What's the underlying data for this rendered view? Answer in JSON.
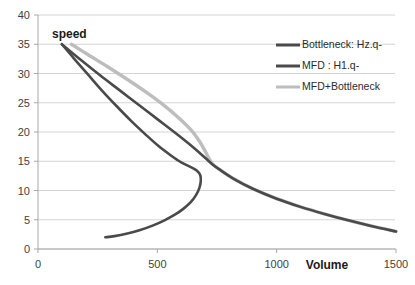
{
  "chart_data": {
    "type": "line",
    "title": "",
    "xlabel": "Volume",
    "ylabel": "speed",
    "xlim": [
      0,
      1500
    ],
    "ylim": [
      0,
      40
    ],
    "xticks": [
      "0",
      "500",
      "1000",
      "1500"
    ],
    "xtick_values": [
      0,
      500,
      1000,
      1500
    ],
    "yticks": [
      "0",
      "5",
      "10",
      "15",
      "20",
      "25",
      "30",
      "35",
      "40"
    ],
    "ytick_values": [
      0,
      5,
      10,
      15,
      20,
      25,
      30,
      35,
      40
    ],
    "grid": "horizontal",
    "legend_position": "upper-right-inside",
    "series": [
      {
        "name": "Bottleneck: Hz.q-",
        "color": "#4a4a4a",
        "width": 2.6,
        "points": [
          [
            100,
            35.0
          ],
          [
            150,
            32.6
          ],
          [
            210,
            29.8
          ],
          [
            270,
            27.0
          ],
          [
            330,
            24.4
          ],
          [
            390,
            21.9
          ],
          [
            450,
            19.6
          ],
          [
            505,
            17.6
          ],
          [
            560,
            15.9
          ],
          [
            600,
            14.8
          ],
          [
            640,
            14.0
          ],
          [
            665,
            13.4
          ],
          [
            680,
            12.6
          ],
          [
            682,
            11.6
          ],
          [
            676,
            10.4
          ],
          [
            662,
            9.2
          ],
          [
            640,
            8.0
          ],
          [
            610,
            6.9
          ],
          [
            575,
            5.9
          ],
          [
            530,
            4.9
          ],
          [
            480,
            4.0
          ],
          [
            425,
            3.2
          ],
          [
            370,
            2.6
          ],
          [
            320,
            2.2
          ],
          [
            282,
            2.0
          ]
        ]
      },
      {
        "name": "MFD : H1.q-",
        "color": "#4a4a4a",
        "width": 2.6,
        "points": [
          [
            100,
            35.0
          ],
          [
            180,
            32.3
          ],
          [
            260,
            29.7
          ],
          [
            340,
            27.2
          ],
          [
            420,
            24.7
          ],
          [
            500,
            22.2
          ],
          [
            580,
            19.7
          ],
          [
            650,
            17.4
          ],
          [
            700,
            15.6
          ],
          [
            730,
            14.5
          ],
          [
            760,
            13.6
          ],
          [
            820,
            12.0
          ],
          [
            900,
            10.3
          ],
          [
            1000,
            8.6
          ],
          [
            1100,
            7.2
          ],
          [
            1200,
            6.0
          ],
          [
            1300,
            4.9
          ],
          [
            1400,
            3.9
          ],
          [
            1500,
            3.0
          ]
        ]
      },
      {
        "name": "MFD+Bottleneck",
        "color": "#bdbdbd",
        "width": 3.4,
        "points": [
          [
            140,
            35.0
          ],
          [
            210,
            33.2
          ],
          [
            290,
            31.2
          ],
          [
            370,
            29.1
          ],
          [
            450,
            26.9
          ],
          [
            520,
            24.8
          ],
          [
            590,
            22.4
          ],
          [
            640,
            20.4
          ],
          [
            675,
            18.5
          ],
          [
            698,
            16.9
          ],
          [
            715,
            15.6
          ],
          [
            730,
            14.6
          ],
          [
            760,
            13.6
          ],
          [
            820,
            12.0
          ],
          [
            900,
            10.3
          ],
          [
            1000,
            8.6
          ],
          [
            1100,
            7.2
          ],
          [
            1200,
            6.0
          ],
          [
            1300,
            4.9
          ],
          [
            1400,
            3.9
          ],
          [
            1500,
            3.0
          ]
        ]
      }
    ],
    "legend": [
      {
        "label": "Bottleneck: Hz.q-",
        "color": "#4a4a4a",
        "width": 3
      },
      {
        "label": "MFD : H1.q-",
        "color": "#4a4a4a",
        "width": 3
      },
      {
        "label": "MFD+Bottleneck",
        "color": "#bdbdbd",
        "width": 3
      }
    ],
    "colors": {
      "grid": "#c9c9c9",
      "axis": "#a8a8a8",
      "text": "#3f3f3f",
      "dark_series": "#4a4a4a",
      "light_series": "#bdbdbd",
      "background": "#ffffff"
    }
  }
}
